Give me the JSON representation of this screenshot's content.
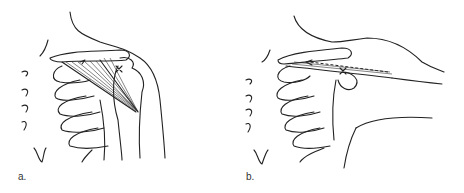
{
  "figure": {
    "panels": [
      {
        "id": "a",
        "label": "a.",
        "description": "Shoulder anterior view with fan-shaped muscle fibers converging from clavicle toward humerus"
      },
      {
        "id": "b",
        "label": "b.",
        "description": "Shoulder with arm abducted; dashed arrow along clavicle toward humerus, x marker at joint"
      }
    ]
  }
}
